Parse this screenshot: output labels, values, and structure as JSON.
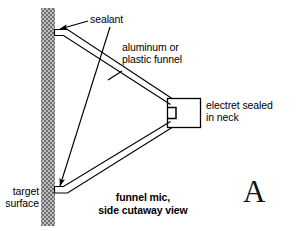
{
  "figure": {
    "panel_letter": "A",
    "caption_line1": "funnel mic,",
    "caption_line2": "side cutaway view",
    "labels": {
      "sealant": "sealant",
      "funnel_line1": "aluminum or",
      "funnel_line2": "plastic funnel",
      "electret_line1": "electret sealed",
      "electret_line2": "in neck",
      "target_line1": "target",
      "target_line2": "surface"
    },
    "colors": {
      "stroke": "#000000",
      "background": "#ffffff",
      "wall_fill": "#8a8a8a",
      "wall_light": "#c8c8c8",
      "text": "#000000",
      "panel_letter": "#111111"
    },
    "geometry": {
      "wall_x": 41,
      "wall_width": 14,
      "wall_top": 8,
      "wall_bottom": 226,
      "neck_x": 167,
      "neck_y": 98,
      "neck_width": 34,
      "neck_height": 29
    }
  }
}
